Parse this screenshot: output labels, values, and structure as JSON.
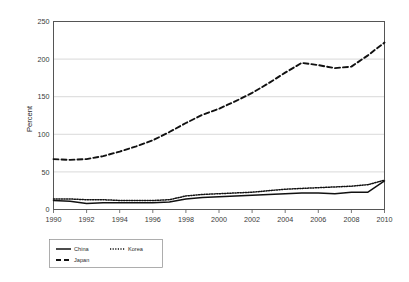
{
  "chart_data": {
    "type": "line",
    "title": "",
    "xlabel": "",
    "ylabel": "Percent",
    "xlim": [
      1990,
      2010
    ],
    "ylim": [
      0,
      250
    ],
    "grid": true,
    "legend_position": "bottom-left",
    "x": [
      1990,
      1991,
      1992,
      1993,
      1994,
      1995,
      1996,
      1997,
      1998,
      1999,
      2000,
      2001,
      2002,
      2003,
      2004,
      2005,
      2006,
      2007,
      2008,
      2009,
      2010
    ],
    "xticks": [
      "1990",
      "1992",
      "1994",
      "1996",
      "1998",
      "2000",
      "2002",
      "2004",
      "2006",
      "2008",
      "2010"
    ],
    "xtick_values": [
      1990,
      1992,
      1994,
      1996,
      1998,
      2000,
      2002,
      2004,
      2006,
      2008,
      2010
    ],
    "yticks": [
      "0",
      "50",
      "100",
      "150",
      "200",
      "250"
    ],
    "ytick_values": [
      0,
      50,
      100,
      150,
      200,
      250
    ],
    "series": [
      {
        "name": "China",
        "style": "solid",
        "values": [
          12,
          11,
          8,
          9,
          9,
          9,
          9,
          10,
          14,
          16,
          17,
          18,
          19,
          20,
          21,
          22,
          22,
          21,
          23,
          23,
          38
        ]
      },
      {
        "name": "Korea",
        "style": "dotted",
        "values": [
          14,
          14,
          13,
          13,
          12,
          12,
          12,
          13,
          18,
          20,
          21,
          22,
          23,
          25,
          27,
          28,
          29,
          30,
          31,
          33,
          39
        ]
      },
      {
        "name": "Japan",
        "style": "dashed",
        "values": [
          67,
          66,
          67,
          71,
          77,
          84,
          92,
          103,
          115,
          126,
          134,
          144,
          155,
          168,
          182,
          195,
          192,
          188,
          190,
          205,
          222
        ]
      }
    ]
  },
  "legend": {
    "items": [
      {
        "label": "China",
        "style": "solid"
      },
      {
        "label": "Korea",
        "style": "dotted"
      },
      {
        "label": "Japan",
        "style": "dashed"
      }
    ]
  },
  "axes": {
    "y_title": "Percent"
  },
  "colors": {
    "line": "#111111",
    "grid": "#c9c9c9",
    "frame": "#555555",
    "background": "#ffffff"
  }
}
